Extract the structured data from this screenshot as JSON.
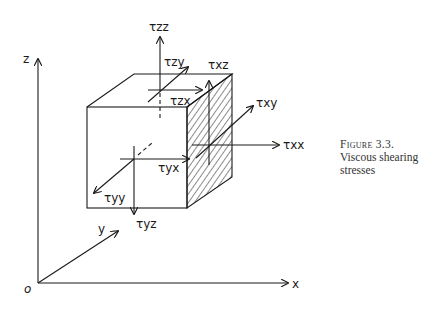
{
  "figure": {
    "number_label": "Figure 3.3.",
    "caption_line1": "Viscous shearing",
    "caption_line2": "stresses"
  },
  "axes": {
    "z_label": "z",
    "y_label": "y",
    "x_label": "x",
    "origin_label": "o"
  },
  "stress_labels": {
    "tzz": "τzz",
    "tzy": "τzy",
    "tzx": "τzx",
    "txz": "τxz",
    "txy": "τxy",
    "txx": "τxx",
    "tyx": "τyx",
    "tyy": "τyy",
    "tyz": "τyz"
  },
  "colors": {
    "ink": "#1a1a1a",
    "background": "#ffffff"
  }
}
